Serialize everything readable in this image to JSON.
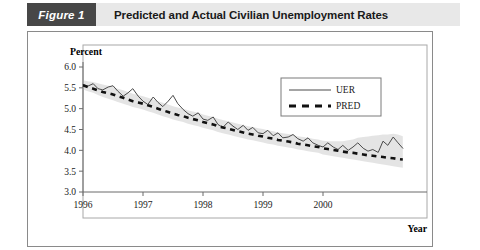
{
  "header": {
    "figure_number": "Figure 1",
    "title": "Predicted and Actual Civilian Unemployment Rates"
  },
  "chart_data": {
    "type": "line",
    "title": "Predicted and Actual Civilian Unemployment Rates",
    "xlabel": "Year",
    "ylabel": "Percent",
    "xlim": [
      1996.0,
      2001.5
    ],
    "ylim": [
      3.0,
      6.0
    ],
    "ytick_labels": [
      "6.0",
      "5.5",
      "5.0",
      "4.5",
      "4.0",
      "3.5",
      "3.0"
    ],
    "ytick_values": [
      6.0,
      5.5,
      5.0,
      4.5,
      4.0,
      3.5,
      3.0
    ],
    "xtick_labels": [
      "1996",
      "1997",
      "1998",
      "1999",
      "2000"
    ],
    "xtick_values": [
      1996,
      1997,
      1998,
      1999,
      2000
    ],
    "grid": false,
    "legend_position": "top-right",
    "legend": [
      {
        "name": "UER",
        "style": "solid",
        "color": "#4a4a4a"
      },
      {
        "name": "PRED",
        "style": "dashed",
        "color": "#111111"
      }
    ],
    "x": [
      1996.0,
      1996.08,
      1996.17,
      1996.25,
      1996.33,
      1996.42,
      1996.5,
      1996.58,
      1996.67,
      1996.75,
      1996.83,
      1996.92,
      1997.0,
      1997.08,
      1997.17,
      1997.25,
      1997.33,
      1997.42,
      1997.5,
      1997.58,
      1997.67,
      1997.75,
      1997.83,
      1997.92,
      1998.0,
      1998.08,
      1998.17,
      1998.25,
      1998.33,
      1998.42,
      1998.5,
      1998.58,
      1998.67,
      1998.75,
      1998.83,
      1998.92,
      1999.0,
      1999.08,
      1999.17,
      1999.25,
      1999.33,
      1999.42,
      1999.5,
      1999.58,
      1999.67,
      1999.75,
      1999.83,
      1999.92,
      2000.0,
      2000.08,
      2000.17,
      2000.25,
      2000.33,
      2000.42,
      2000.5,
      2000.58,
      2000.67,
      2000.75,
      2000.83,
      2000.92,
      2001.0,
      2001.08,
      2001.17,
      2001.25,
      2001.33
    ],
    "series": [
      {
        "name": "UER",
        "style": "solid",
        "values": [
          5.58,
          5.54,
          5.6,
          5.48,
          5.45,
          5.52,
          5.55,
          5.42,
          5.3,
          5.38,
          5.48,
          5.3,
          5.18,
          5.1,
          5.28,
          5.15,
          5.05,
          5.18,
          5.32,
          5.12,
          4.98,
          4.88,
          4.82,
          4.9,
          4.75,
          4.72,
          4.8,
          4.62,
          4.55,
          4.68,
          4.58,
          4.5,
          4.6,
          4.48,
          4.55,
          4.42,
          4.4,
          4.48,
          4.35,
          4.42,
          4.3,
          4.32,
          4.38,
          4.28,
          4.22,
          4.3,
          4.18,
          4.12,
          4.08,
          4.18,
          4.08,
          4.02,
          4.12,
          4.0,
          4.08,
          4.18,
          4.05,
          3.98,
          4.02,
          3.95,
          4.22,
          4.12,
          4.32,
          4.18,
          4.05
        ]
      },
      {
        "name": "PRED",
        "style": "dashed",
        "values": [
          5.56,
          5.52,
          5.48,
          5.44,
          5.4,
          5.37,
          5.34,
          5.3,
          5.26,
          5.22,
          5.18,
          5.15,
          5.12,
          5.08,
          5.04,
          5.0,
          4.96,
          4.92,
          4.88,
          4.85,
          4.82,
          4.78,
          4.75,
          4.72,
          4.68,
          4.65,
          4.62,
          4.58,
          4.55,
          4.52,
          4.49,
          4.46,
          4.43,
          4.4,
          4.38,
          4.35,
          4.33,
          4.3,
          4.28,
          4.25,
          4.23,
          4.21,
          4.19,
          4.16,
          4.14,
          4.12,
          4.1,
          4.08,
          4.05,
          4.03,
          4.01,
          3.99,
          3.97,
          3.95,
          3.94,
          3.92,
          3.9,
          3.88,
          3.87,
          3.85,
          3.84,
          3.82,
          3.81,
          3.79,
          3.78
        ]
      }
    ],
    "confidence_band": {
      "upper": [
        5.68,
        5.66,
        5.64,
        5.61,
        5.58,
        5.55,
        5.52,
        5.48,
        5.44,
        5.4,
        5.36,
        5.33,
        5.3,
        5.26,
        5.22,
        5.18,
        5.14,
        5.1,
        5.06,
        5.03,
        5.0,
        4.96,
        4.93,
        4.9,
        4.86,
        4.83,
        4.8,
        4.76,
        4.73,
        4.7,
        4.67,
        4.64,
        4.61,
        4.58,
        4.56,
        4.53,
        4.51,
        4.48,
        4.46,
        4.43,
        4.41,
        4.39,
        4.37,
        4.34,
        4.32,
        4.3,
        4.28,
        4.26,
        4.23,
        4.22,
        4.22,
        4.22,
        4.22,
        4.24,
        4.26,
        4.3,
        4.32,
        4.33,
        4.35,
        4.36,
        4.38,
        4.38,
        4.4,
        4.38,
        4.34
      ],
      "lower": [
        5.46,
        5.42,
        5.38,
        5.33,
        5.28,
        5.24,
        5.2,
        5.16,
        5.12,
        5.08,
        5.04,
        5.01,
        4.98,
        4.94,
        4.9,
        4.86,
        4.82,
        4.78,
        4.74,
        4.71,
        4.68,
        4.64,
        4.61,
        4.58,
        4.54,
        4.51,
        4.48,
        4.44,
        4.41,
        4.38,
        4.35,
        4.32,
        4.29,
        4.26,
        4.24,
        4.21,
        4.19,
        4.16,
        4.14,
        4.11,
        4.09,
        4.07,
        4.05,
        4.02,
        4.0,
        3.98,
        3.96,
        3.94,
        3.9,
        3.88,
        3.86,
        3.84,
        3.82,
        3.8,
        3.78,
        3.76,
        3.74,
        3.72,
        3.7,
        3.68,
        3.66,
        3.64,
        3.62,
        3.6,
        3.58
      ]
    }
  }
}
